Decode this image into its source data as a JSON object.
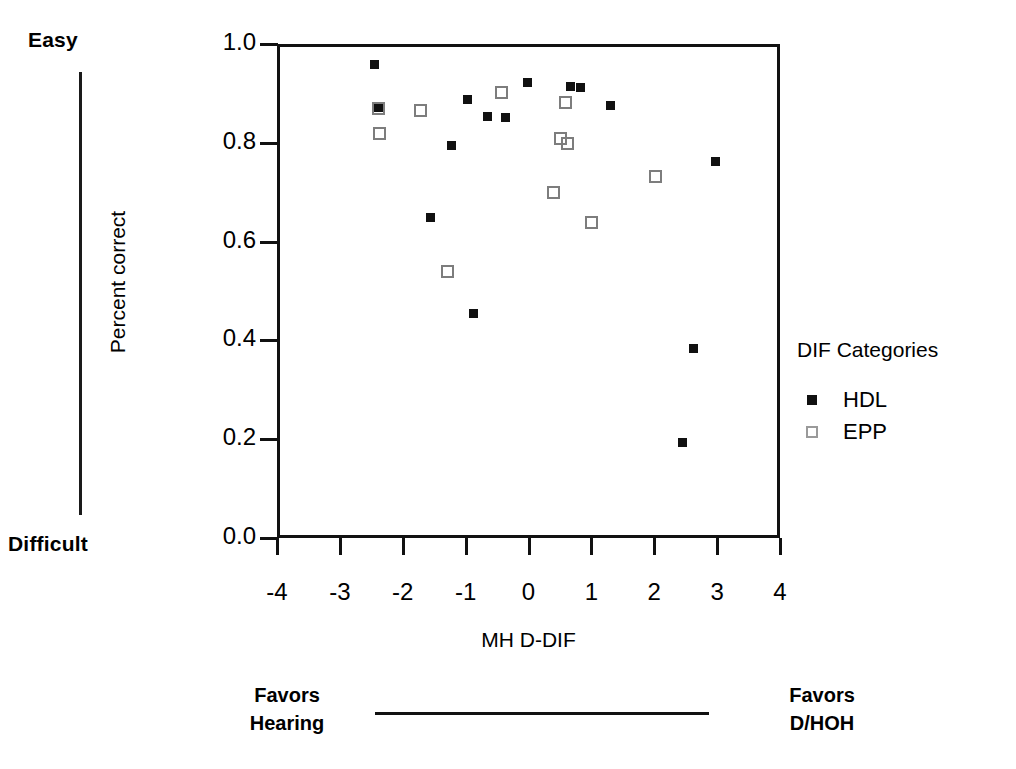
{
  "chart_data": {
    "type": "scatter",
    "title": "",
    "xlabel": "MH D-DIF",
    "ylabel": "Percent correct",
    "xlim": [
      -4,
      4
    ],
    "ylim": [
      0.0,
      1.0
    ],
    "xticks": [
      -4,
      -3,
      -2,
      -1,
      0,
      1,
      2,
      3,
      4
    ],
    "xtick_labels": [
      "-4",
      "-3",
      "-2",
      "-1",
      "0",
      "1",
      "2",
      "3",
      "4"
    ],
    "yticks": [
      0.0,
      0.2,
      0.4,
      0.6,
      0.8,
      1.0
    ],
    "ytick_labels": [
      "0.0",
      "0.2",
      "0.4",
      "0.6",
      "0.8",
      "1.0"
    ],
    "grid": false,
    "legend_position": "right",
    "legend_title": "DIF Categories",
    "series": [
      {
        "name": "HDL",
        "marker": "filled-square",
        "color": "#111111",
        "points": [
          {
            "x": -2.5,
            "y": 0.965
          },
          {
            "x": -2.44,
            "y": 0.877
          },
          {
            "x": -1.02,
            "y": 0.893
          },
          {
            "x": -0.7,
            "y": 0.86
          },
          {
            "x": -0.42,
            "y": 0.857
          },
          {
            "x": -1.28,
            "y": 0.8
          },
          {
            "x": -1.61,
            "y": 0.655
          },
          {
            "x": -0.93,
            "y": 0.46
          },
          {
            "x": -0.07,
            "y": 0.928
          },
          {
            "x": 0.62,
            "y": 0.92
          },
          {
            "x": 0.78,
            "y": 0.918
          },
          {
            "x": 1.26,
            "y": 0.882
          },
          {
            "x": 2.93,
            "y": 0.768
          },
          {
            "x": 2.57,
            "y": 0.39
          },
          {
            "x": 2.4,
            "y": 0.2
          }
        ]
      },
      {
        "name": "EPP",
        "marker": "open-square",
        "color": "#7d7d7d",
        "points": [
          {
            "x": -2.43,
            "y": 0.875
          },
          {
            "x": -2.41,
            "y": 0.825
          },
          {
            "x": -1.76,
            "y": 0.872
          },
          {
            "x": -0.47,
            "y": 0.908
          },
          {
            "x": 0.54,
            "y": 0.888
          },
          {
            "x": 0.46,
            "y": 0.815
          },
          {
            "x": 0.57,
            "y": 0.805
          },
          {
            "x": 0.35,
            "y": 0.705
          },
          {
            "x": 0.95,
            "y": 0.645
          },
          {
            "x": -1.33,
            "y": 0.545
          },
          {
            "x": 1.98,
            "y": 0.737
          }
        ]
      }
    ]
  },
  "annotations": {
    "difficulty_top": "Easy",
    "difficulty_bottom": "Difficult",
    "favors_left_line1": "Favors",
    "favors_left_line2": "Hearing",
    "favors_right_line1": "Favors",
    "favors_right_line2": "D/HOH"
  },
  "legend": {
    "title": "DIF Categories",
    "entries": [
      {
        "label": "HDL",
        "marker": "filled-square"
      },
      {
        "label": "EPP",
        "marker": "open-square"
      }
    ]
  }
}
